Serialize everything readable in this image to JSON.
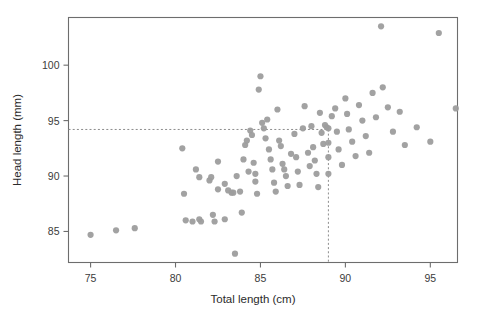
{
  "figure": {
    "name": "possum-scatter-plot",
    "background": "#ffffff",
    "point_color": "#9d9d9d",
    "axis_color": "#6d6d6d",
    "guide_color": "#8c8c8c"
  },
  "chart_data": {
    "type": "scatter",
    "title": "",
    "xlabel": "Total length (cm)",
    "ylabel": "Head length (mm)",
    "xlim": [
      73.7,
      96.6
    ],
    "ylim": [
      82.2,
      104.3
    ],
    "xticks": [
      75,
      80,
      85,
      90,
      95
    ],
    "xticklabels": [
      "75",
      "80",
      "85",
      "90",
      "95"
    ],
    "yticks": [
      85,
      90,
      95,
      100
    ],
    "yticklabels": [
      "85",
      "90",
      "95",
      "100"
    ],
    "grid": false,
    "legend": null,
    "annotations": [
      {
        "name": "horizontal-guide",
        "type": "hline",
        "y": 94.2,
        "style": "dashed",
        "note": "predicted head length at total length 89 cm"
      },
      {
        "name": "vertical-guide",
        "type": "vline",
        "x": 89.0,
        "style": "dashed",
        "y_from": 82.2,
        "y_to": 94.2,
        "note": "total length 89 cm reference"
      }
    ],
    "marker": {
      "shape": "circle",
      "radius_px": 3.1,
      "color": "#9d9d9d",
      "opacity": 0.95
    },
    "n_points": 104,
    "points": [
      [
        75.0,
        84.7
      ],
      [
        76.5,
        85.1
      ],
      [
        77.6,
        85.3
      ],
      [
        80.4,
        92.5
      ],
      [
        80.5,
        88.4
      ],
      [
        80.6,
        86.0
      ],
      [
        81.0,
        85.9
      ],
      [
        81.2,
        90.6
      ],
      [
        81.4,
        89.9
      ],
      [
        81.4,
        86.1
      ],
      [
        81.5,
        85.9
      ],
      [
        82.0,
        89.6
      ],
      [
        82.1,
        89.9
      ],
      [
        82.2,
        86.5
      ],
      [
        82.3,
        85.9
      ],
      [
        82.5,
        88.8
      ],
      [
        82.5,
        91.3
      ],
      [
        82.9,
        89.3
      ],
      [
        82.9,
        86.1
      ],
      [
        83.1,
        88.7
      ],
      [
        83.3,
        88.5
      ],
      [
        83.4,
        88.5
      ],
      [
        83.5,
        83.0
      ],
      [
        83.6,
        90.0
      ],
      [
        83.8,
        88.6
      ],
      [
        83.9,
        86.7
      ],
      [
        84.0,
        91.5
      ],
      [
        84.1,
        92.8
      ],
      [
        84.2,
        93.2
      ],
      [
        84.3,
        90.4
      ],
      [
        84.4,
        94.1
      ],
      [
        84.5,
        93.7
      ],
      [
        84.6,
        91.2
      ],
      [
        84.7,
        90.2
      ],
      [
        84.7,
        89.5
      ],
      [
        84.8,
        88.4
      ],
      [
        84.9,
        97.8
      ],
      [
        85.0,
        99.0
      ],
      [
        85.1,
        94.8
      ],
      [
        85.2,
        94.3
      ],
      [
        85.3,
        93.4
      ],
      [
        85.4,
        95.1
      ],
      [
        85.5,
        92.4
      ],
      [
        85.6,
        91.5
      ],
      [
        85.7,
        90.6
      ],
      [
        85.8,
        89.4
      ],
      [
        85.9,
        88.6
      ],
      [
        86.0,
        96.0
      ],
      [
        86.1,
        93.2
      ],
      [
        86.2,
        92.7
      ],
      [
        86.3,
        91.1
      ],
      [
        86.4,
        90.6
      ],
      [
        86.5,
        90.0
      ],
      [
        86.6,
        89.1
      ],
      [
        86.8,
        92.0
      ],
      [
        87.0,
        93.8
      ],
      [
        87.1,
        91.7
      ],
      [
        87.2,
        90.4
      ],
      [
        87.3,
        89.2
      ],
      [
        87.5,
        94.3
      ],
      [
        87.6,
        96.3
      ],
      [
        87.8,
        92.1
      ],
      [
        87.9,
        90.9
      ],
      [
        88.0,
        94.5
      ],
      [
        88.1,
        92.6
      ],
      [
        88.2,
        91.4
      ],
      [
        88.3,
        90.2
      ],
      [
        88.4,
        89.0
      ],
      [
        88.5,
        95.7
      ],
      [
        88.6,
        93.9
      ],
      [
        88.7,
        92.9
      ],
      [
        88.8,
        94.6
      ],
      [
        88.9,
        94.4
      ],
      [
        89.0,
        94.3
      ],
      [
        89.0,
        93.0
      ],
      [
        89.0,
        91.7
      ],
      [
        89.0,
        90.2
      ],
      [
        89.2,
        95.4
      ],
      [
        89.4,
        96.1
      ],
      [
        89.5,
        94.0
      ],
      [
        89.6,
        92.4
      ],
      [
        89.8,
        91.0
      ],
      [
        90.0,
        97.0
      ],
      [
        90.1,
        95.6
      ],
      [
        90.2,
        94.2
      ],
      [
        90.4,
        93.1
      ],
      [
        90.6,
        91.8
      ],
      [
        90.8,
        96.4
      ],
      [
        91.0,
        95.0
      ],
      [
        91.2,
        93.6
      ],
      [
        91.4,
        92.1
      ],
      [
        91.6,
        97.5
      ],
      [
        91.8,
        95.3
      ],
      [
        92.1,
        103.5
      ],
      [
        92.2,
        98.0
      ],
      [
        92.5,
        96.2
      ],
      [
        92.8,
        94.0
      ],
      [
        93.2,
        95.8
      ],
      [
        93.5,
        92.8
      ],
      [
        94.2,
        94.4
      ],
      [
        95.0,
        93.1
      ],
      [
        95.5,
        102.9
      ],
      [
        96.5,
        96.1
      ]
    ]
  }
}
